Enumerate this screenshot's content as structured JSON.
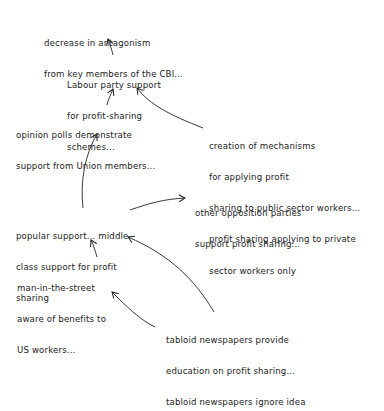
{
  "diagram": {
    "type": "influence-diagram",
    "style": "handwritten",
    "nodes": [
      {
        "id": "cbi",
        "lines": [
          "decrease in antagonism",
          "from key members of the CBI..."
        ]
      },
      {
        "id": "labour",
        "lines": [
          "Labour party support",
          "for profit-sharing",
          "schemes..."
        ]
      },
      {
        "id": "polls",
        "lines": [
          "opinion polls demonstrate",
          "support from Union members..."
        ]
      },
      {
        "id": "mechanisms",
        "lines": [
          "creation of mechanisms",
          "for applying profit",
          "sharing to public sector workers...",
          "profit sharing applying to private",
          "sector workers only"
        ]
      },
      {
        "id": "popular",
        "lines": [
          "popular support... middle",
          "class support for profit",
          "sharing"
        ]
      },
      {
        "id": "opposition",
        "lines": [
          "other opposition parties",
          "support profit sharing..."
        ]
      },
      {
        "id": "man",
        "lines": [
          "man-in-the-street",
          "aware of benefits to",
          "US workers..."
        ]
      },
      {
        "id": "tabloid",
        "lines": [
          "tabloid newspapers provide",
          "education on profit sharing...",
          "tabloid newspapers ignore idea"
        ]
      }
    ],
    "edges": [
      {
        "from": "labour",
        "to": "cbi"
      },
      {
        "from": "polls",
        "to": "labour"
      },
      {
        "from": "mechanisms",
        "to": "labour"
      },
      {
        "from": "popular",
        "to": "polls"
      },
      {
        "from": "popular",
        "to": "opposition"
      },
      {
        "from": "man",
        "to": "popular"
      },
      {
        "from": "tabloid",
        "to": "popular"
      },
      {
        "from": "tabloid",
        "to": "man"
      }
    ],
    "colors": {
      "ink": "#222222",
      "background": "#ffffff"
    }
  }
}
